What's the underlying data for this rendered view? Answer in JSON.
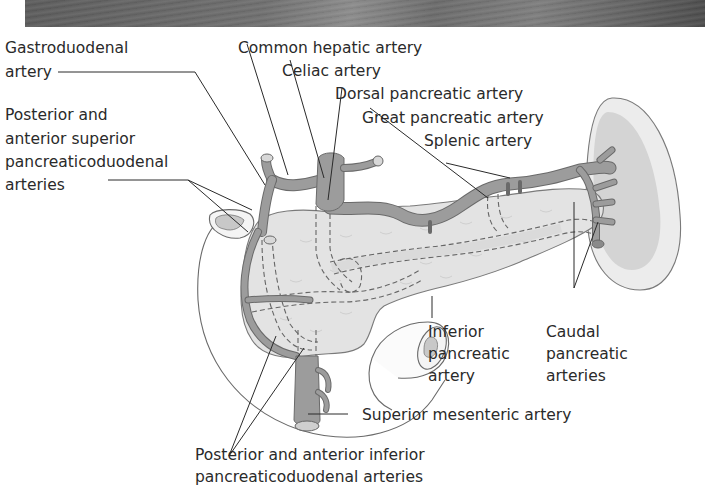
{
  "figure": {
    "banner": "decorative-header-strip",
    "labels": {
      "gastroduodenal_l1": "Gastroduodenal",
      "gastroduodenal_l2": "artery",
      "common_hepatic": "Common hepatic artery",
      "celiac": "Celiac artery",
      "dorsal_pancreatic": "Dorsal pancreatic artery",
      "great_pancreatic": "Great pancreatic artery",
      "splenic": "Splenic artery",
      "pasp_l1": "Posterior and",
      "pasp_l2": "anterior superior",
      "pasp_l3": "pancreaticoduodenal",
      "pasp_l4": "arteries",
      "inferior_l1": "Inferior",
      "inferior_l2": "pancreatic",
      "inferior_l3": "artery",
      "caudal_l1": "Caudal",
      "caudal_l2": "pancreatic",
      "caudal_l3": "arteries",
      "sma": "Superior mesenteric artery",
      "paip_l1": "Posterior and anterior inferior",
      "paip_l2": "pancreaticoduodenal arteries"
    },
    "colors": {
      "artery_fill": "#9c9c9c",
      "pancreas_fill": "#e3e3e3",
      "spleen_outer": "#ececec",
      "spleen_inner": "#d4d4d4",
      "text": "#2a2a2a"
    }
  }
}
